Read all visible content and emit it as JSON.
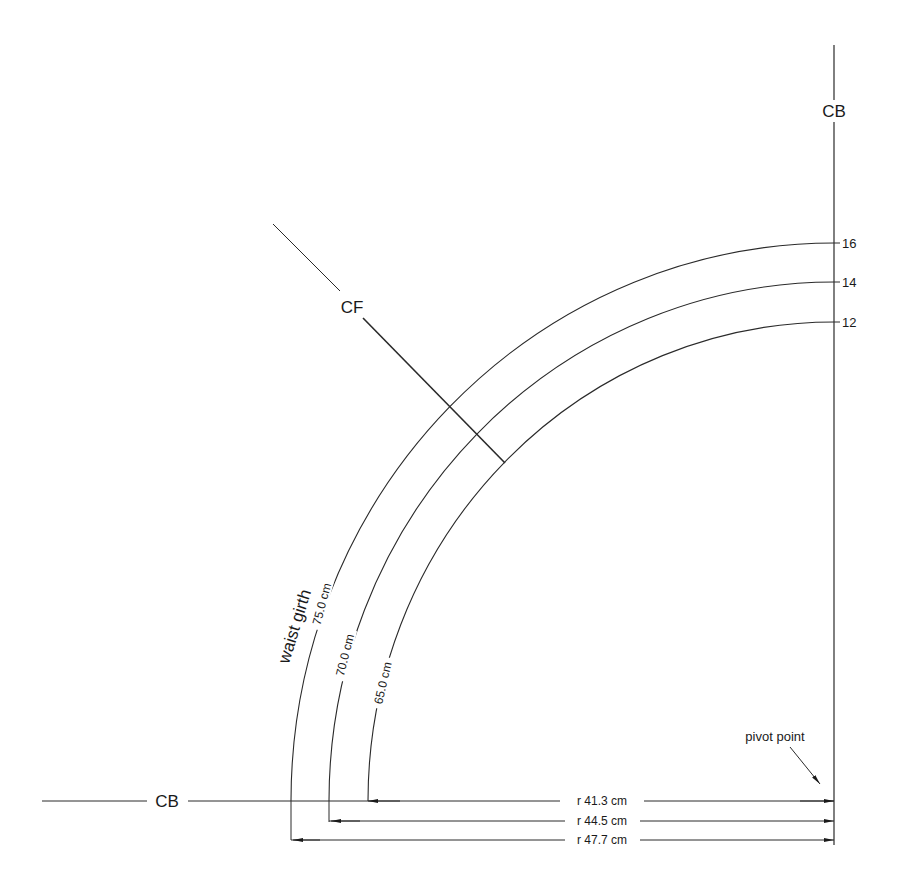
{
  "labels": {
    "cb_top": "CB",
    "cb_left": "CB",
    "cf": "CF",
    "waist_girth": "waist girth",
    "pivot_point": "pivot point"
  },
  "sizes": [
    {
      "size": "16",
      "girth": "75.0 cm",
      "radius": "r 47.7 cm"
    },
    {
      "size": "14",
      "girth": "70.0 cm",
      "radius": "r 44.5 cm"
    },
    {
      "size": "12",
      "girth": "65.0 cm",
      "radius": "r 41.3 cm"
    }
  ],
  "colors": {
    "ink": "#2a2a2a",
    "background": "#ffffff"
  }
}
